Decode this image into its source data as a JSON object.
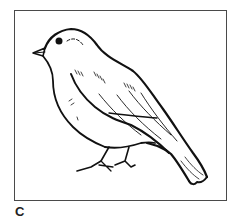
{
  "figure": {
    "label": "C",
    "colors": {
      "ink": "#111111",
      "frame": "#4a4a4a",
      "background": "#ffffff"
    }
  }
}
